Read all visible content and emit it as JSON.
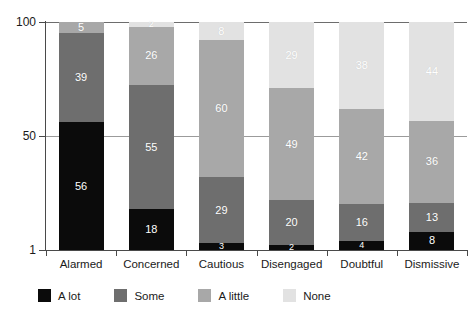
{
  "chart_data": {
    "type": "bar",
    "subtype": "stacked-bar-100",
    "title": "",
    "xlabel": "",
    "ylabel": "",
    "ylim": [
      1,
      100
    ],
    "yticks": [
      "100",
      "50",
      "1"
    ],
    "grid": true,
    "legend_position": "bottom-left",
    "categories": [
      "Alarmed",
      "Concerned",
      "Cautious",
      "Disengaged",
      "Doubtful",
      "Dismissive"
    ],
    "series": [
      {
        "name": "A lot",
        "color": "#0b0b0b",
        "values": [
          56,
          18,
          3,
          2,
          4,
          8
        ]
      },
      {
        "name": "Some",
        "color": "#6e6e6e",
        "values": [
          39,
          55,
          29,
          20,
          16,
          13
        ]
      },
      {
        "name": "A little",
        "color": "#a8a8a8",
        "values": [
          5,
          26,
          60,
          49,
          42,
          36
        ]
      },
      {
        "name": "None",
        "color": "#e2e2e2",
        "values": [
          0,
          2,
          8,
          29,
          38,
          44
        ]
      }
    ]
  },
  "axis": {
    "y_top_label": "100",
    "y_mid_label": "50",
    "y_bottom_label": "1"
  },
  "legend": {
    "items": [
      {
        "label": "A lot",
        "color": "#0b0b0b"
      },
      {
        "label": "Some",
        "color": "#6e6e6e"
      },
      {
        "label": "A little",
        "color": "#a8a8a8"
      },
      {
        "label": "None",
        "color": "#e2e2e2"
      }
    ]
  }
}
